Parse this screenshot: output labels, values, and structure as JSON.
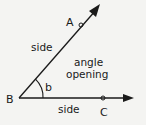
{
  "diagram": {
    "type": "angle",
    "labels": {
      "point_a": "A",
      "point_b": "B",
      "point_c": "C",
      "angle_name": "b",
      "upper_side": "side",
      "lower_side": "side",
      "opening_line1": "angle",
      "opening_line2": "opening"
    },
    "colors": {
      "line": "#1a1a1a",
      "background": "#f4f4f2"
    }
  }
}
